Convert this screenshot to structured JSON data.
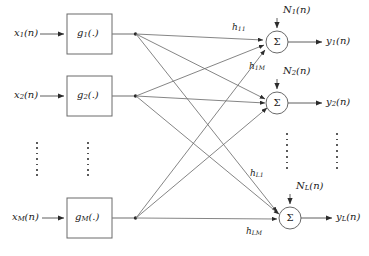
{
  "figure": {
    "type": "block-diagram",
    "width": 369,
    "height": 256,
    "background": "#ffffff",
    "stroke": "#4d4d4d",
    "text_color": "#1a1a1a"
  },
  "inputs": [
    {
      "id": "x1",
      "base": "x",
      "sub": "1",
      "suffix": "(n)",
      "text": "x",
      "x": 14,
      "y": 34
    },
    {
      "id": "x2",
      "base": "x",
      "sub": "2",
      "suffix": "(n)",
      "text": "x",
      "x": 14,
      "y": 96
    },
    {
      "id": "xM",
      "base": "x",
      "sub": "M",
      "suffix": "(n)",
      "text": "x",
      "x": 12,
      "y": 218
    }
  ],
  "blocks": [
    {
      "id": "g1",
      "base": "g",
      "sub": "1",
      "suffix": "(.)",
      "x": 67,
      "y": 14,
      "w": 45,
      "h": 40
    },
    {
      "id": "g2",
      "base": "g",
      "sub": "2",
      "suffix": "(.)",
      "x": 67,
      "y": 76,
      "w": 45,
      "h": 40
    },
    {
      "id": "gM",
      "base": "g",
      "sub": "M",
      "suffix": "(.)",
      "x": 67,
      "y": 198,
      "w": 45,
      "h": 40
    }
  ],
  "summers": [
    {
      "id": "sum1",
      "glyph": "Σ",
      "cx": 277,
      "cy": 42,
      "r": 11
    },
    {
      "id": "sum2",
      "glyph": "Σ",
      "cx": 277,
      "cy": 103,
      "r": 11
    },
    {
      "id": "sumL",
      "glyph": "Σ",
      "cx": 290,
      "cy": 218,
      "r": 11
    }
  ],
  "noises": [
    {
      "id": "N1",
      "base": "N",
      "sub": "1",
      "suffix": "(n)",
      "x": 283,
      "y": 9
    },
    {
      "id": "N2",
      "base": "N",
      "sub": "2",
      "suffix": "(n)",
      "x": 283,
      "y": 70
    },
    {
      "id": "NL",
      "base": "N",
      "sub": "L",
      "suffix": "(n)",
      "x": 296,
      "y": 185
    }
  ],
  "outputs": [
    {
      "id": "y1",
      "base": "y",
      "sub": "1",
      "suffix": "(n)",
      "x": 326,
      "y": 37
    },
    {
      "id": "y2",
      "base": "y",
      "sub": "2",
      "suffix": "(n)",
      "x": 326,
      "y": 98
    },
    {
      "id": "yL",
      "base": "y",
      "sub": "L",
      "suffix": "(n)",
      "x": 336,
      "y": 213
    }
  ],
  "gain_labels": [
    {
      "id": "h11",
      "base": "h",
      "sub": "11",
      "x": 232,
      "y": 25
    },
    {
      "id": "h1M",
      "base": "h",
      "sub": "1M",
      "x": 249,
      "y": 64
    },
    {
      "id": "hL1",
      "base": "h",
      "sub": "L1",
      "x": 250,
      "y": 171
    },
    {
      "id": "hLM",
      "base": "h",
      "sub": "LM",
      "x": 246,
      "y": 229
    }
  ],
  "ellipses": [
    {
      "id": "dots-inputs",
      "x": 37,
      "y": 142,
      "h": 34,
      "count": 7
    },
    {
      "id": "dots-blocks",
      "x": 88,
      "y": 142,
      "h": 34,
      "count": 7
    },
    {
      "id": "dots-summers",
      "x": 287,
      "y": 133,
      "h": 36,
      "count": 7
    },
    {
      "id": "dots-outputs",
      "x": 337,
      "y": 133,
      "h": 36,
      "count": 7
    }
  ],
  "connections": {
    "note": "each g-block output fans out to all three summers",
    "fanout_x": 135,
    "rows_y": [
      34,
      96,
      218
    ]
  }
}
